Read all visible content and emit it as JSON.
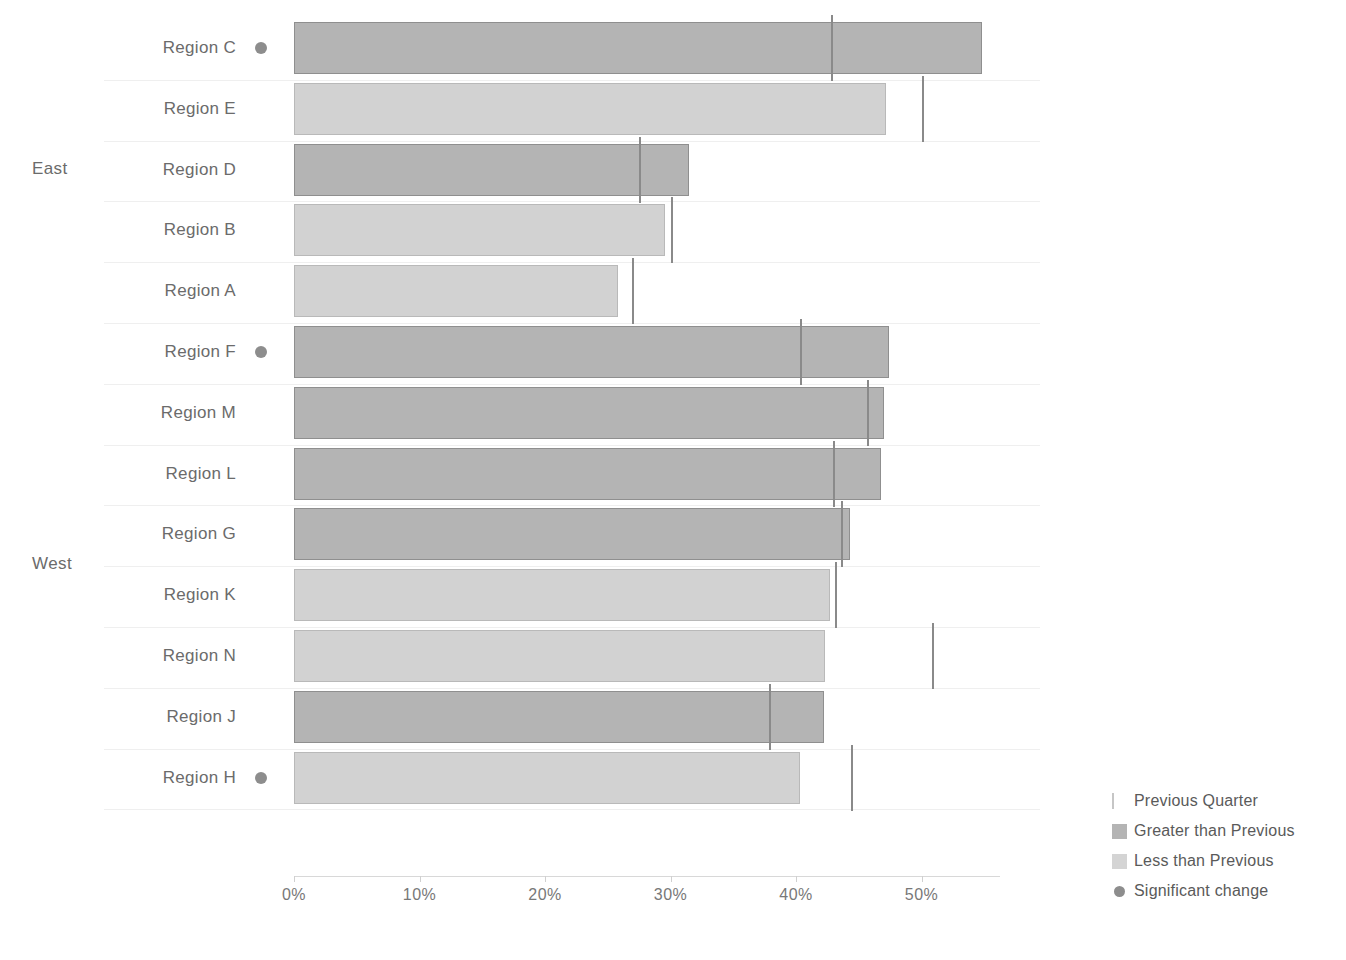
{
  "chart_data": {
    "type": "bar",
    "orientation": "horizontal",
    "title": "",
    "xlabel": "",
    "ylabel": "",
    "xlim": [
      0,
      56
    ],
    "xticks": [
      0,
      10,
      20,
      30,
      40,
      50
    ],
    "xtick_labels": [
      "0%",
      "10%",
      "20%",
      "30%",
      "40%",
      "50%"
    ],
    "grid": false,
    "legend_position": "bottom-right",
    "groups": [
      {
        "name": "East",
        "rows": [
          {
            "label": "Region C",
            "value": 54.8,
            "previous": 42.9,
            "state": "greater",
            "significant": true
          },
          {
            "label": "Region E",
            "value": 47.2,
            "previous": 50.1,
            "state": "less",
            "significant": false
          },
          {
            "label": "Region D",
            "value": 31.5,
            "previous": 27.6,
            "state": "greater",
            "significant": false
          },
          {
            "label": "Region B",
            "value": 29.6,
            "previous": 30.1,
            "state": "less",
            "significant": false
          },
          {
            "label": "Region A",
            "value": 25.8,
            "previous": 27.0,
            "state": "less",
            "significant": false
          }
        ]
      },
      {
        "name": "West",
        "rows": [
          {
            "label": "Region F",
            "value": 47.4,
            "previous": 40.4,
            "state": "greater",
            "significant": true
          },
          {
            "label": "Region M",
            "value": 47.0,
            "previous": 45.7,
            "state": "greater",
            "significant": false
          },
          {
            "label": "Region L",
            "value": 46.8,
            "previous": 43.0,
            "state": "greater",
            "significant": false
          },
          {
            "label": "Region G",
            "value": 44.3,
            "previous": 43.7,
            "state": "greater",
            "significant": false
          },
          {
            "label": "Region K",
            "value": 42.7,
            "previous": 43.2,
            "state": "less",
            "significant": false
          },
          {
            "label": "Region N",
            "value": 42.3,
            "previous": 50.9,
            "state": "less",
            "significant": false
          },
          {
            "label": "Region J",
            "value": 42.2,
            "previous": 37.9,
            "state": "greater",
            "significant": false
          },
          {
            "label": "Region H",
            "value": 40.3,
            "previous": 44.5,
            "state": "less",
            "significant": true
          }
        ]
      }
    ],
    "legend": [
      {
        "label": "Previous Quarter",
        "mark": "reference-line"
      },
      {
        "label": "Greater than Previous",
        "mark": "swatch-greater"
      },
      {
        "label": "Less than Previous",
        "mark": "swatch-less"
      },
      {
        "label": "Significant change",
        "mark": "dot"
      }
    ],
    "colors": {
      "greater": "#b4b4b4",
      "less": "#d2d2d2",
      "reference": "#8a8a8a",
      "dot": "#8d8d8d",
      "text": "#5a5a5a"
    }
  }
}
